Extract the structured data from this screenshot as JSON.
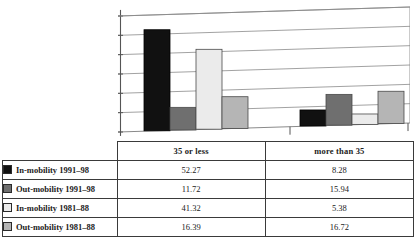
{
  "chart_data": {
    "type": "bar",
    "title": "",
    "subtitle": "",
    "xlabel": "",
    "ylabel": "",
    "grid": true,
    "gridlines": 6,
    "legend_position": "table-left",
    "axis_tick_labels_visible": false,
    "ylim": [
      0,
      60
    ],
    "categories": [
      "35 or less",
      "more than 35"
    ],
    "series": [
      {
        "name": "In-mobility 1991–98",
        "color": "#111111",
        "values": [
          52.27,
          8.28
        ]
      },
      {
        "name": "Out-mobility 1991–98",
        "color": "#6f6f6f",
        "values": [
          11.72,
          15.94
        ]
      },
      {
        "name": "In-mobility 1981–88",
        "color": "#ebebeb",
        "values": [
          41.32,
          5.38
        ]
      },
      {
        "name": "Out-mobility 1981–88",
        "color": "#b5b5b5",
        "values": [
          16.39,
          16.72
        ]
      }
    ]
  },
  "table": {
    "corner_label": "",
    "column_headers": [
      "35 or less",
      "more than 35"
    ],
    "rows": [
      {
        "label": "In-mobility 1991–98",
        "swatch": "legend-swatch-black",
        "values": [
          "52.27",
          "8.28"
        ]
      },
      {
        "label": "Out-mobility 1991–98",
        "swatch": "legend-swatch-dark-gray",
        "values": [
          "11.72",
          "15.94"
        ]
      },
      {
        "label": "In-mobility 1981–88",
        "swatch": "legend-swatch-white",
        "values": [
          "41.32",
          "5.38"
        ]
      },
      {
        "label": "Out-mobility 1981–88",
        "swatch": "legend-swatch-light-gray",
        "values": [
          "16.39",
          "16.72"
        ]
      }
    ]
  },
  "colors": {
    "series_1": "#111111",
    "series_2": "#6f6f6f",
    "series_3": "#ebebeb",
    "series_4": "#b5b5b5",
    "grid": "#8a8a8a",
    "axis": "#555555",
    "border": "#3a3a3a"
  }
}
